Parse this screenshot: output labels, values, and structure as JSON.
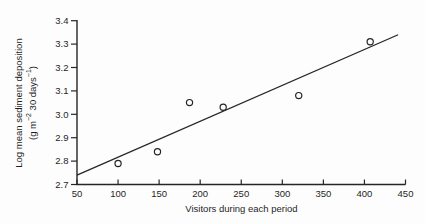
{
  "figure": {
    "background": "#fdfdfd",
    "ink_color": "#262626"
  },
  "chart_data": {
    "type": "scatter",
    "title": "",
    "xlabel": "Visitors during each period",
    "ylabel_line1": "Log mean sediment deposition",
    "ylabel_line2_parts": {
      "p1": "(g m",
      "sup1": "−2",
      "p2": " 30 days",
      "sup2": "−1",
      "p3": ")"
    },
    "xlim": [
      50,
      450
    ],
    "ylim": [
      2.7,
      3.4
    ],
    "x_ticks": [
      "50",
      "100",
      "150",
      "200",
      "250",
      "300",
      "350",
      "400",
      "450"
    ],
    "y_ticks": [
      "2.7",
      "2.8",
      "2.9",
      "3.0",
      "3.1",
      "3.2",
      "3.3",
      "3.4"
    ],
    "grid": false,
    "legend": null,
    "points": [
      {
        "x": 100,
        "y": 2.79
      },
      {
        "x": 148,
        "y": 2.84
      },
      {
        "x": 187,
        "y": 3.05
      },
      {
        "x": 228,
        "y": 3.03
      },
      {
        "x": 320,
        "y": 3.08
      },
      {
        "x": 407,
        "y": 3.31
      }
    ],
    "trend_line": {
      "x1": 50,
      "y1": 2.74,
      "x2": 441,
      "y2": 3.34
    }
  }
}
